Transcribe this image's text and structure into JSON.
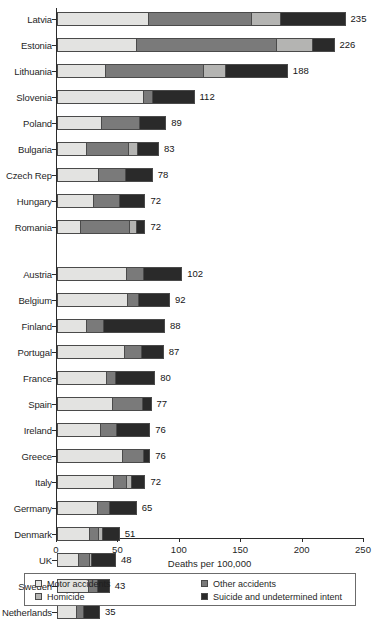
{
  "chart_data": {
    "type": "bar",
    "orientation": "horizontal",
    "stacked": true,
    "title": "",
    "xlabel": "Deaths per 100,000",
    "ylabel": "",
    "xlim": [
      0,
      250
    ],
    "xticks": [
      0,
      50,
      100,
      150,
      200,
      250
    ],
    "xtick_labels": [
      "0",
      "50",
      "100",
      "150",
      "200",
      "250"
    ],
    "grid": false,
    "legend_position": "bottom",
    "series": [
      {
        "name": "Motor accidents",
        "color": "#e3e3e1",
        "values": [
          74,
          64,
          39,
          70,
          36,
          23,
          33,
          29,
          18,
          56,
          57,
          23,
          55,
          40,
          45,
          35,
          53,
          46,
          33,
          26,
          17,
          25,
          15
        ]
      },
      {
        "name": "Other accidents",
        "color": "#7a7a7a",
        "values": [
          84,
          115,
          80,
          8,
          31,
          35,
          23,
          22,
          41,
          14,
          9,
          14,
          14,
          7,
          25,
          13,
          18,
          11,
          10,
          8,
          9,
          8,
          6
        ]
      },
      {
        "name": "Homicide",
        "color": "#b4b4b2",
        "values": [
          24,
          29,
          18,
          0,
          0,
          8,
          0,
          0,
          6,
          0,
          0,
          0,
          0,
          0,
          0,
          0,
          0,
          4,
          0,
          3,
          2,
          0,
          0
        ]
      },
      {
        "name": "Suicide and undetermined intent",
        "color": "#2a2a2a",
        "values": [
          53,
          18,
          51,
          34,
          22,
          17,
          22,
          21,
          7,
          32,
          26,
          51,
          18,
          33,
          7,
          28,
          5,
          11,
          22,
          14,
          20,
          10,
          14
        ]
      }
    ],
    "groups": [
      {
        "name": "group-1",
        "categories": [
          "Latvia",
          "Estonia",
          "Lithuania",
          "Slovenia",
          "Poland",
          "Bulgaria",
          "Czech Rep",
          "Hungary",
          "Romania"
        ],
        "totals": [
          235,
          226,
          188,
          112,
          89,
          83,
          78,
          72,
          72
        ],
        "total_labels": [
          "235",
          "226",
          "188",
          "112",
          "89",
          "83",
          "78",
          "72",
          "72"
        ]
      },
      {
        "name": "group-2",
        "categories": [
          "Austria",
          "Belgium",
          "Finland",
          "Portugal",
          "France",
          "Spain",
          "Ireland",
          "Greece",
          "Italy",
          "Germany",
          "Denmark",
          "UK",
          "Sweden",
          "Netherlands"
        ],
        "totals": [
          102,
          92,
          88,
          87,
          80,
          77,
          76,
          76,
          72,
          65,
          51,
          48,
          43,
          35
        ],
        "total_labels": [
          "102",
          "92",
          "88",
          "87",
          "80",
          "77",
          "76",
          "76",
          "72",
          "65",
          "51",
          "48",
          "43",
          "35"
        ]
      }
    ],
    "rows": [
      {
        "category": "Latvia",
        "total": 235,
        "label": "235",
        "y": 10,
        "segments": [
          {
            "series": "Motor accidents",
            "value": 74
          },
          {
            "series": "Other accidents",
            "value": 84
          },
          {
            "series": "Homicide",
            "value": 24
          },
          {
            "series": "Suicide and undetermined intent",
            "value": 53
          }
        ]
      },
      {
        "category": "Estonia",
        "total": 226,
        "label": "226",
        "y": 36,
        "segments": [
          {
            "series": "Motor accidents",
            "value": 64
          },
          {
            "series": "Other accidents",
            "value": 115
          },
          {
            "series": "Homicide",
            "value": 29
          },
          {
            "series": "Suicide and undetermined intent",
            "value": 18
          }
        ]
      },
      {
        "category": "Lithuania",
        "total": 188,
        "label": "188",
        "y": 62,
        "segments": [
          {
            "series": "Motor accidents",
            "value": 39
          },
          {
            "series": "Other accidents",
            "value": 80
          },
          {
            "series": "Homicide",
            "value": 18
          },
          {
            "series": "Suicide and undetermined intent",
            "value": 51
          }
        ]
      },
      {
        "category": "Slovenia",
        "total": 112,
        "label": "112",
        "y": 88,
        "segments": [
          {
            "series": "Motor accidents",
            "value": 70
          },
          {
            "series": "Other accidents",
            "value": 8
          },
          {
            "series": "Suicide and undetermined intent",
            "value": 34
          }
        ]
      },
      {
        "category": "Poland",
        "total": 89,
        "label": "89",
        "y": 114,
        "segments": [
          {
            "series": "Motor accidents",
            "value": 36
          },
          {
            "series": "Other accidents",
            "value": 31
          },
          {
            "series": "Suicide and undetermined intent",
            "value": 22
          }
        ]
      },
      {
        "category": "Bulgaria",
        "total": 83,
        "label": "83",
        "y": 140,
        "segments": [
          {
            "series": "Motor accidents",
            "value": 23
          },
          {
            "series": "Other accidents",
            "value": 35
          },
          {
            "series": "Homicide",
            "value": 8
          },
          {
            "series": "Suicide and undetermined intent",
            "value": 17
          }
        ]
      },
      {
        "category": "Czech Rep",
        "total": 78,
        "label": "78",
        "y": 166,
        "segments": [
          {
            "series": "Motor accidents",
            "value": 33
          },
          {
            "series": "Other accidents",
            "value": 23
          },
          {
            "series": "Suicide and undetermined intent",
            "value": 22
          }
        ]
      },
      {
        "category": "Hungary",
        "total": 72,
        "label": "72",
        "y": 192,
        "segments": [
          {
            "series": "Motor accidents",
            "value": 29
          },
          {
            "series": "Other accidents",
            "value": 22
          },
          {
            "series": "Suicide and undetermined intent",
            "value": 21
          }
        ]
      },
      {
        "category": "Romania",
        "total": 72,
        "label": "72",
        "y": 218,
        "segments": [
          {
            "series": "Motor accidents",
            "value": 18
          },
          {
            "series": "Other accidents",
            "value": 41
          },
          {
            "series": "Homicide",
            "value": 6
          },
          {
            "series": "Suicide and undetermined intent",
            "value": 7
          }
        ]
      },
      {
        "category": "Austria",
        "total": 102,
        "label": "102",
        "y": 265,
        "segments": [
          {
            "series": "Motor accidents",
            "value": 56
          },
          {
            "series": "Other accidents",
            "value": 14
          },
          {
            "series": "Suicide and undetermined intent",
            "value": 32
          }
        ]
      },
      {
        "category": "Belgium",
        "total": 92,
        "label": "92",
        "y": 291,
        "segments": [
          {
            "series": "Motor accidents",
            "value": 57
          },
          {
            "series": "Other accidents",
            "value": 9
          },
          {
            "series": "Suicide and undetermined intent",
            "value": 26
          }
        ]
      },
      {
        "category": "Finland",
        "total": 88,
        "label": "88",
        "y": 317,
        "segments": [
          {
            "series": "Motor accidents",
            "value": 23
          },
          {
            "series": "Other accidents",
            "value": 14
          },
          {
            "series": "Suicide and undetermined intent",
            "value": 51
          }
        ]
      },
      {
        "category": "Portugal",
        "total": 87,
        "label": "87",
        "y": 343,
        "segments": [
          {
            "series": "Motor accidents",
            "value": 55
          },
          {
            "series": "Other accidents",
            "value": 14
          },
          {
            "series": "Suicide and undetermined intent",
            "value": 18
          }
        ]
      },
      {
        "category": "France",
        "total": 80,
        "label": "80",
        "y": 369,
        "segments": [
          {
            "series": "Motor accidents",
            "value": 40
          },
          {
            "series": "Other accidents",
            "value": 7
          },
          {
            "series": "Suicide and undetermined intent",
            "value": 33
          }
        ]
      },
      {
        "category": "Spain",
        "total": 77,
        "label": "77",
        "y": 395,
        "segments": [
          {
            "series": "Motor accidents",
            "value": 45
          },
          {
            "series": "Other accidents",
            "value": 25
          },
          {
            "series": "Suicide and undetermined intent",
            "value": 7
          }
        ]
      },
      {
        "category": "Ireland",
        "total": 76,
        "label": "76",
        "y": 421,
        "segments": [
          {
            "series": "Motor accidents",
            "value": 35
          },
          {
            "series": "Other accidents",
            "value": 13
          },
          {
            "series": "Suicide and undetermined intent",
            "value": 28
          }
        ]
      },
      {
        "category": "Greece",
        "total": 76,
        "label": "76",
        "y": 447,
        "segments": [
          {
            "series": "Motor accidents",
            "value": 53
          },
          {
            "series": "Other accidents",
            "value": 18
          },
          {
            "series": "Suicide and undetermined intent",
            "value": 5
          }
        ]
      },
      {
        "category": "Italy",
        "total": 72,
        "label": "72",
        "y": 473,
        "segments": [
          {
            "series": "Motor accidents",
            "value": 46
          },
          {
            "series": "Other accidents",
            "value": 11
          },
          {
            "series": "Homicide",
            "value": 4
          },
          {
            "series": "Suicide and undetermined intent",
            "value": 11
          }
        ]
      },
      {
        "category": "Germany",
        "total": 65,
        "label": "65",
        "y": 499,
        "segments": [
          {
            "series": "Motor accidents",
            "value": 33
          },
          {
            "series": "Other accidents",
            "value": 10
          },
          {
            "series": "Suicide and undetermined intent",
            "value": 22
          }
        ]
      },
      {
        "category": "Denmark",
        "total": 51,
        "label": "51",
        "y": 525,
        "segments": [
          {
            "series": "Motor accidents",
            "value": 26
          },
          {
            "series": "Other accidents",
            "value": 8
          },
          {
            "series": "Homicide",
            "value": 3
          },
          {
            "series": "Suicide and undetermined intent",
            "value": 14
          }
        ]
      },
      {
        "category": "UK",
        "total": 48,
        "label": "48",
        "y": 551,
        "segments": [
          {
            "series": "Motor accidents",
            "value": 17
          },
          {
            "series": "Other accidents",
            "value": 9
          },
          {
            "series": "Homicide",
            "value": 2
          },
          {
            "series": "Suicide and undetermined intent",
            "value": 20
          }
        ]
      },
      {
        "category": "Sweden",
        "total": 43,
        "label": "43",
        "y": 577,
        "segments": [
          {
            "series": "Motor accidents",
            "value": 25
          },
          {
            "series": "Other accidents",
            "value": 8
          },
          {
            "series": "Suicide and undetermined intent",
            "value": 10
          }
        ]
      },
      {
        "category": "Netherlands",
        "total": 35,
        "label": "35",
        "y": 603,
        "segments": [
          {
            "series": "Motor accidents",
            "value": 15
          },
          {
            "series": "Other accidents",
            "value": 6
          },
          {
            "series": "Suicide and undetermined intent",
            "value": 14
          }
        ]
      }
    ]
  },
  "legend": {
    "entries": [
      {
        "label": "Motor accidents",
        "color": "#e3e3e1"
      },
      {
        "label": "Homicide",
        "color": "#b4b4b2"
      },
      {
        "label": "Other accidents",
        "color": "#7a7a7a"
      },
      {
        "label": "Suicide and undetermined intent",
        "color": "#2a2a2a"
      }
    ]
  },
  "axis": {
    "x_title": "Deaths per 100,000",
    "x_tick_labels": [
      "0",
      "50",
      "100",
      "150",
      "200",
      "250"
    ]
  },
  "source_note": ""
}
